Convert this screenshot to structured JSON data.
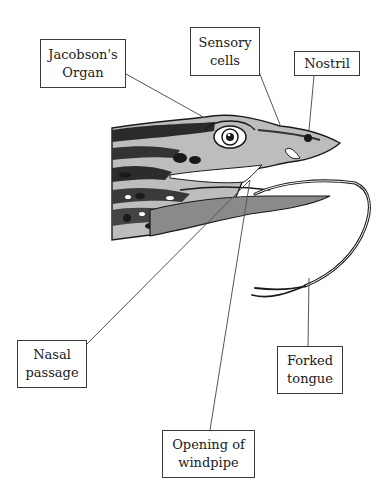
{
  "diagram": {
    "labels": [
      {
        "id": "jacobsons-organ",
        "lines": [
          "Jacobson's",
          "Organ"
        ]
      },
      {
        "id": "sensory-cells",
        "lines": [
          "Sensory",
          "cells"
        ]
      },
      {
        "id": "nostril",
        "lines": [
          "Nostril"
        ]
      },
      {
        "id": "nasal-passage",
        "lines": [
          "Nasal",
          "passage"
        ]
      },
      {
        "id": "forked-tongue",
        "lines": [
          "Forked",
          "tongue"
        ]
      },
      {
        "id": "opening-of-windpipe",
        "lines": [
          "Opening of",
          "windpipe"
        ]
      }
    ],
    "colors": {
      "line": "#555555",
      "ink": "#1a1a1a",
      "border": "#3a3a3a",
      "background": "#ffffff"
    }
  }
}
